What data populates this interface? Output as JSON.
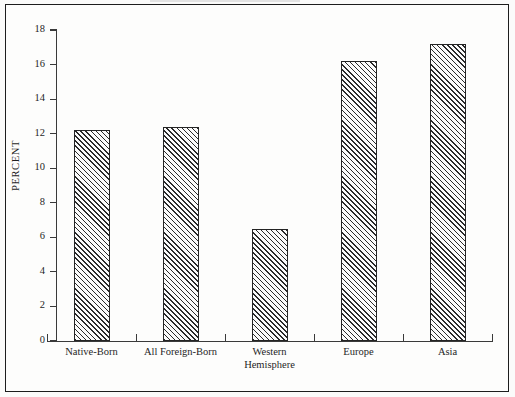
{
  "chart_data": {
    "type": "bar",
    "title": "",
    "subtitle": "",
    "xlabel": "",
    "ylabel": "PERCENT",
    "categories": [
      "Native-Born",
      "All Foreign-Born",
      "Western Hemisphere",
      "Europe",
      "Asia"
    ],
    "category_lines": [
      [
        "Native-Born"
      ],
      [
        "All Foreign-Born"
      ],
      [
        "Western",
        "Hemisphere"
      ],
      [
        "Europe"
      ],
      [
        "Asia"
      ]
    ],
    "values": [
      12.2,
      12.4,
      6.5,
      16.2,
      17.2
    ],
    "ylim": [
      0,
      18
    ],
    "ytick_labels": [
      "0",
      "2",
      "4",
      "6",
      "8",
      "10",
      "12",
      "14",
      "16",
      "18"
    ],
    "ytick_values": [
      0,
      2,
      4,
      6,
      8,
      10,
      12,
      14,
      16,
      18
    ],
    "grid": false,
    "legend": false,
    "legend_position": "none",
    "bar_fill": "diagonal-hatch",
    "bar_outline_color": "#242424",
    "hatch_color": "#2a2a2a",
    "background_color": "#fdfdfc",
    "frame": true,
    "annotations": []
  },
  "figure": {
    "frame_border_color": "#1d1d1d",
    "axis_color": "#3a3a3a",
    "text_color": "#1f1f1f"
  }
}
